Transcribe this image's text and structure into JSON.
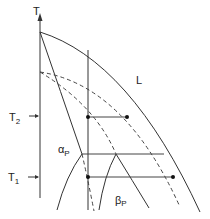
{
  "diagram": {
    "type": "phase-diagram",
    "axis": {
      "label": "T"
    },
    "temperature_marks": [
      {
        "label": "T",
        "subscript": "2"
      },
      {
        "label": "T",
        "subscript": "1"
      }
    ],
    "regions": {
      "liquid": "L",
      "alpha": {
        "symbol": "α",
        "subscript": "P"
      },
      "beta": {
        "symbol": "β",
        "subscript": "P"
      }
    },
    "curves": [
      {
        "name": "liquidus",
        "style": "solid"
      },
      {
        "name": "alpha-solidus",
        "style": "solid"
      },
      {
        "name": "metastable-liquidus",
        "style": "dashed"
      },
      {
        "name": "metastable-solidus",
        "style": "dashed"
      },
      {
        "name": "alpha-solvus",
        "style": "solid"
      },
      {
        "name": "beta-boundaries",
        "style": "solid"
      },
      {
        "name": "composition-line",
        "style": "solid"
      }
    ],
    "tie_lines": [
      {
        "level": "T2",
        "dots": 2
      },
      {
        "level": "eutectic",
        "dots": 0
      },
      {
        "level": "T1",
        "dots": 2
      }
    ]
  }
}
